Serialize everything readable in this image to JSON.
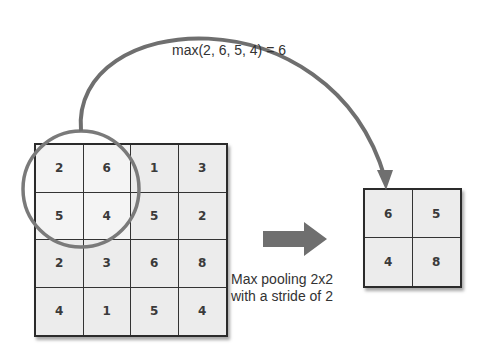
{
  "title_formula": "max(2, 6, 5, 4) = 6",
  "caption": {
    "line1": "Max pooling 2x2",
    "line2": "with a stride of 2"
  },
  "input_matrix": {
    "rows": [
      [
        "2",
        "6",
        "1",
        "3"
      ],
      [
        "5",
        "4",
        "5",
        "2"
      ],
      [
        "2",
        "3",
        "6",
        "8"
      ],
      [
        "4",
        "1",
        "5",
        "4"
      ]
    ],
    "highlighted_window": [
      [
        0,
        0
      ],
      [
        0,
        1
      ],
      [
        1,
        0
      ],
      [
        1,
        1
      ]
    ]
  },
  "output_matrix": {
    "rows": [
      [
        "6",
        "5"
      ],
      [
        "4",
        "8"
      ]
    ]
  },
  "colors": {
    "arrow": "#6f6f6f",
    "circle": "#7a7a7a",
    "cell_fill": "#ececec",
    "grid_line": "#2b2b2b",
    "text": "#333333"
  },
  "icons": {
    "block_arrow": "right-arrow-icon",
    "curved_arrow": "curved-arrow-icon"
  }
}
